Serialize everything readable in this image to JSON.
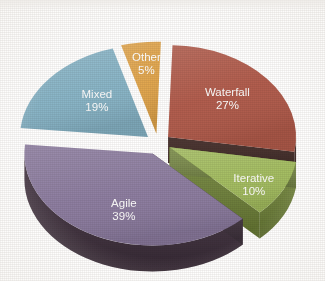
{
  "chart_data": {
    "type": "pie",
    "title": "",
    "subtitle": "",
    "xlabel": "",
    "ylabel": "",
    "legend_position": "none",
    "grid": false,
    "style": "exploded-3d-pie",
    "background_color": "#FFFFFF",
    "label_text_color": "#FFFFFF",
    "total": 100,
    "units": "%",
    "categories": [
      "Waterfall",
      "Iterative",
      "Agile",
      "Mixed",
      "Other"
    ],
    "values": [
      27,
      10,
      39,
      19,
      5
    ],
    "slices": [
      {
        "label": "Waterfall",
        "value": 27,
        "value_text": "27%",
        "color": "#B05A4A",
        "side_color": "#3A221E",
        "start_angle": -88,
        "end_angle": 9.2
      },
      {
        "label": "Iterative",
        "value": 10,
        "value_text": "10%",
        "color": "#A2BC5E",
        "side_color": "#6E8235",
        "start_angle": 9.2,
        "end_angle": 45.2
      },
      {
        "label": "Agile",
        "value": 39,
        "value_text": "39%",
        "color": "#8A7A9E",
        "side_color": "#3E2E3C",
        "start_angle": 45.2,
        "end_angle": 185.6
      },
      {
        "label": "Mixed",
        "value": 19,
        "value_text": "19%",
        "color": "#86B3C6",
        "side_color": "#1E2A33",
        "start_angle": 185.6,
        "end_angle": 254.0
      },
      {
        "label": "Other",
        "value": 5,
        "value_text": "5%",
        "color": "#E0A44A",
        "side_color": "#4A3320",
        "start_angle": 254.0,
        "end_angle": 272.0
      }
    ]
  }
}
